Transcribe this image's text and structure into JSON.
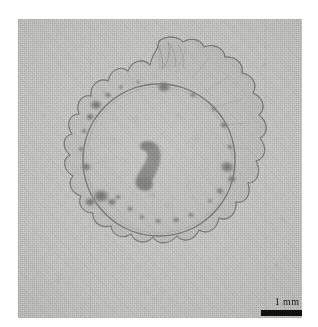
{
  "figure": {
    "kind": "light-micrograph",
    "plate_background_color": "#c9c9c7",
    "page_background_color": "#ffffff",
    "ink_color": "#4a4a48"
  },
  "scalebar": {
    "label": "1 mm",
    "bar_color": "#111111",
    "label_color": "#1a1a1a",
    "bar_width_px": 46,
    "bar_height_px": 6
  },
  "specimen": {
    "outer_rim_name": "scalloped lobed margin",
    "lobe_count": 22,
    "inner_disc_name": "inner circular outline",
    "center_structure_name": "comma-shaped dark body",
    "pigment_spot_count": 26
  }
}
